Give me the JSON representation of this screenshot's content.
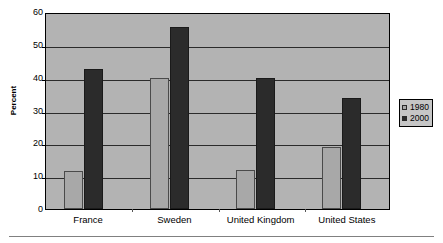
{
  "chart_data": {
    "type": "bar",
    "title": "",
    "subtitle": "",
    "xlabel": "",
    "ylabel": "Percent",
    "categories": [
      "France",
      "Sweden",
      "United Kingdom",
      "United States"
    ],
    "series": [
      {
        "name": "1980",
        "color": "#a8a8a8",
        "values": [
          11.6,
          40.0,
          11.9,
          18.9
        ]
      },
      {
        "name": "2000",
        "color": "#2b2b2b",
        "values": [
          42.5,
          55.3,
          39.8,
          33.8
        ]
      }
    ],
    "ylim": [
      0,
      60
    ],
    "ytick_labels": [
      "0",
      "10",
      "20",
      "30",
      "40",
      "50",
      "60"
    ],
    "ytick_values": [
      0,
      10,
      20,
      30,
      40,
      50,
      60
    ],
    "grid": "horizontal",
    "legend_position": "right",
    "plot_background": "#b3b3b3",
    "legend_background": "#c6c6c6",
    "axis_color": "#000000"
  },
  "legend": {
    "entries": [
      {
        "label": "1980"
      },
      {
        "label": "2000"
      }
    ]
  },
  "y_axis": {
    "title": "Percent",
    "ticks": [
      "60",
      "50",
      "40",
      "30",
      "20",
      "10",
      "0"
    ]
  },
  "x_axis": {
    "ticks": [
      "France",
      "Sweden",
      "United Kingdom",
      "United States"
    ]
  }
}
